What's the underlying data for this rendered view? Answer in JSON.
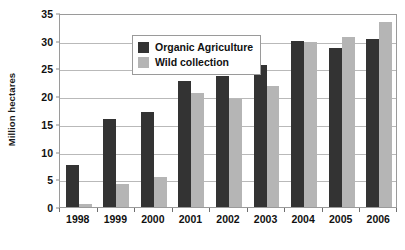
{
  "chart_data": {
    "type": "bar",
    "title": "",
    "subtitle": "",
    "xlabel": "",
    "ylabel": "Million hectares",
    "categories": [
      "1998",
      "1999",
      "2000",
      "2001",
      "2002",
      "2003",
      "2004",
      "2005",
      "2006"
    ],
    "series": [
      {
        "name": "Organic Agriculture",
        "color": "#333333",
        "values": [
          7.5,
          15.8,
          17.2,
          22.7,
          23.7,
          25.7,
          30.0,
          28.7,
          30.4
        ]
      },
      {
        "name": "Wild collection",
        "color": "#b5b5b5",
        "values": [
          0.6,
          4.2,
          5.5,
          20.6,
          19.4,
          21.8,
          29.8,
          30.6,
          33.4
        ]
      }
    ],
    "ylim": [
      0,
      35
    ],
    "yticks": [
      0,
      5,
      10,
      15,
      20,
      25,
      30,
      35
    ],
    "ytick_labels": [
      "0",
      "5",
      "10",
      "15",
      "20",
      "25",
      "30",
      "35"
    ],
    "grid": "horizontal",
    "legend_position": "top-left",
    "legend_entries": [
      "Organic Agriculture",
      "Wild collection"
    ]
  },
  "colors": {
    "organic": "#333333",
    "wild": "#b5b5b5",
    "gridline": "#b9b9b9",
    "frame": "#9a9a9a",
    "text": "#111111",
    "background": "#ffffff"
  }
}
